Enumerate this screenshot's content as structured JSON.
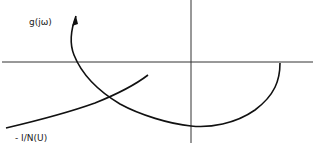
{
  "diagram": {
    "type": "nyquist-describing-function",
    "labels": {
      "g_curve": "g(jω)",
      "describing_function_curve": "- I/N(U)"
    },
    "colors": {
      "axis": "#333333",
      "curve": "#111111",
      "background": "#ffffff"
    }
  }
}
